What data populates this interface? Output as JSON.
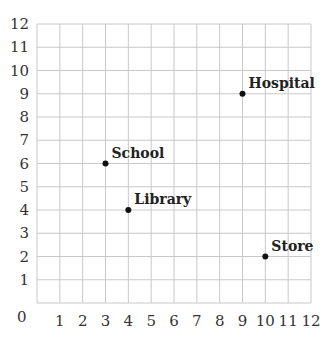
{
  "chart_data": {
    "type": "scatter",
    "title": "",
    "xlabel": "",
    "ylabel": "",
    "xlim": [
      0,
      12
    ],
    "ylim": [
      0,
      12
    ],
    "grid": true,
    "x_ticks": [
      "1",
      "2",
      "3",
      "4",
      "5",
      "6",
      "7",
      "8",
      "9",
      "10",
      "11",
      "12"
    ],
    "y_ticks": [
      "1",
      "2",
      "3",
      "4",
      "5",
      "6",
      "7",
      "8",
      "9",
      "10",
      "11",
      "12"
    ],
    "origin_label": "0",
    "points": [
      {
        "label": "Hospital",
        "x": 9,
        "y": 9
      },
      {
        "label": "School",
        "x": 3,
        "y": 6
      },
      {
        "label": "Library",
        "x": 4,
        "y": 4
      },
      {
        "label": "Store",
        "x": 10,
        "y": 2
      }
    ]
  },
  "colors": {
    "grid": "#c8c8c8",
    "point": "#111111",
    "text": "#333333"
  }
}
